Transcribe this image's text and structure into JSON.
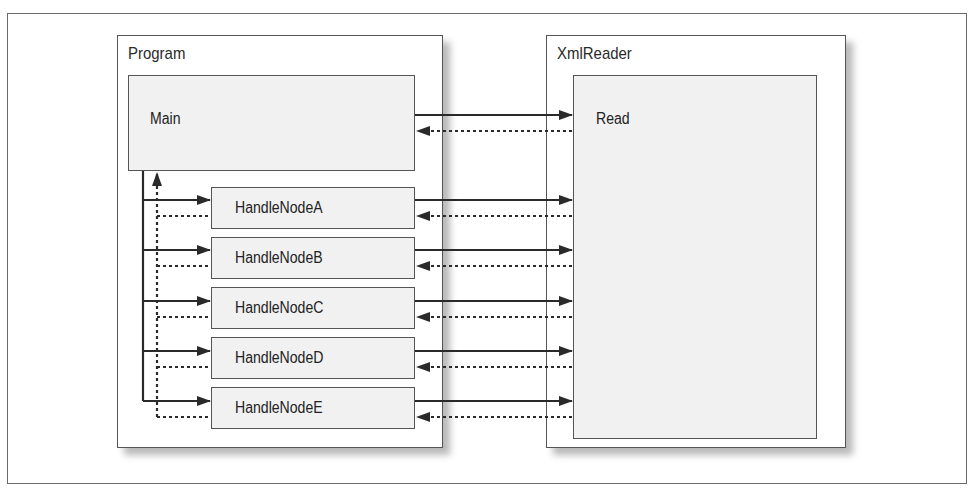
{
  "diagram": {
    "program": {
      "title": "Program",
      "main": "Main",
      "handlers": [
        "HandleNodeA",
        "HandleNodeB",
        "HandleNodeC",
        "HandleNodeD",
        "HandleNodeE"
      ]
    },
    "xmlreader": {
      "title": "XmlReader",
      "method": "Read"
    },
    "edges": [
      {
        "from": "Main",
        "to": "Read",
        "style": "solid",
        "direction": "call"
      },
      {
        "from": "Read",
        "to": "Main",
        "style": "dotted",
        "direction": "return"
      },
      {
        "from": "HandleNodeA",
        "to": "Read",
        "style": "solid"
      },
      {
        "from": "Read",
        "to": "HandleNodeA",
        "style": "dotted"
      },
      {
        "from": "HandleNodeB",
        "to": "Read",
        "style": "solid"
      },
      {
        "from": "Read",
        "to": "HandleNodeB",
        "style": "dotted"
      },
      {
        "from": "HandleNodeC",
        "to": "Read",
        "style": "solid"
      },
      {
        "from": "Read",
        "to": "HandleNodeC",
        "style": "dotted"
      },
      {
        "from": "HandleNodeD",
        "to": "Read",
        "style": "solid"
      },
      {
        "from": "Read",
        "to": "HandleNodeD",
        "style": "dotted"
      },
      {
        "from": "HandleNodeE",
        "to": "Read",
        "style": "solid"
      },
      {
        "from": "Read",
        "to": "HandleNodeE",
        "style": "dotted"
      },
      {
        "from": "Main",
        "to": "HandleNode*",
        "style": "solid",
        "direction": "dispatch"
      },
      {
        "from": "HandleNode*",
        "to": "Main",
        "style": "dotted",
        "direction": "return"
      }
    ]
  }
}
